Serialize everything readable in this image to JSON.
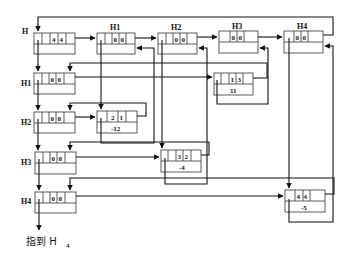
{
  "diagram": {
    "type": "orthogonal-list",
    "head": {
      "label": "H",
      "fields": [
        "4",
        "4"
      ]
    },
    "column_heads": [
      {
        "label": "H1",
        "fields": [
          "0",
          "0"
        ]
      },
      {
        "label": "H2",
        "fields": [
          "0",
          "0"
        ]
      },
      {
        "label": "H3",
        "fields": [
          "0",
          "0"
        ]
      },
      {
        "label": "H4",
        "fields": [
          "0",
          "0"
        ]
      }
    ],
    "row_heads": [
      {
        "label": "H1",
        "fields": [
          "0",
          "0"
        ]
      },
      {
        "label": "H2",
        "fields": [
          "0",
          "0"
        ]
      },
      {
        "label": "H3",
        "fields": [
          "0",
          "0"
        ]
      },
      {
        "label": "H4",
        "fields": [
          "0",
          "0"
        ]
      }
    ],
    "nodes": [
      {
        "row": "1",
        "col": "3",
        "value": "11"
      },
      {
        "row": "2",
        "col": "1",
        "value": "-12"
      },
      {
        "row": "3",
        "col": "2",
        "value": "-4"
      },
      {
        "row": "4",
        "col": "4",
        "value": "-5"
      }
    ],
    "caption": {
      "text": "指到 H",
      "subscript": "4"
    }
  }
}
